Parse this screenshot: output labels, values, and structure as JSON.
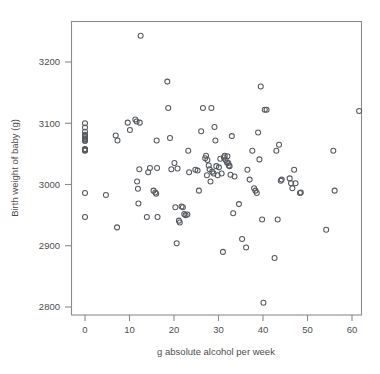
{
  "figure": {
    "title": "",
    "background_color": "#ffffff",
    "point_color": "#555a60",
    "axis_color": "#8a8a8a",
    "text_color": "#4d4d4d"
  },
  "axes": {
    "x_title": "g absolute alcohol per week",
    "y_title": "Birth weight of baby (g)",
    "x_ticks": [
      "0",
      "10",
      "20",
      "30",
      "40",
      "50",
      "60"
    ],
    "y_ticks": [
      "2800",
      "2900",
      "3000",
      "3100",
      "3200"
    ]
  },
  "chart_data": {
    "type": "scatter",
    "title": "",
    "xlabel": "g absolute alcohol per week",
    "ylabel": "Birth weight of baby (g)",
    "xlim": [
      -2.5,
      64.5
    ],
    "ylim": [
      2775,
      3260
    ],
    "x_ticks": [
      0,
      10,
      20,
      30,
      40,
      50,
      60
    ],
    "y_ticks": [
      2800,
      2900,
      3000,
      3100,
      3200
    ],
    "grid": false,
    "legend": null,
    "marker": "open-circle",
    "n_points": 122,
    "x": [
      0,
      0,
      0,
      0,
      0,
      0,
      0,
      0,
      0,
      0,
      0,
      0,
      0,
      0,
      0,
      0,
      0,
      4.7,
      6.9,
      7.3,
      7.2,
      9.6,
      10.1,
      11.3,
      11.6,
      11.7,
      11.9,
      12.0,
      12.2,
      12.3,
      12.5,
      13.9,
      14.2,
      14.6,
      15.4,
      15.8,
      16.0,
      16.1,
      16.2,
      16.3,
      18.5,
      18.7,
      19.1,
      19.4,
      20.1,
      20.3,
      20.6,
      20.8,
      21.1,
      21.3,
      21.7,
      22.0,
      22.3,
      22.6,
      23.0,
      23.2,
      23.4,
      24.8,
      25.3,
      25.6,
      26.1,
      26.5,
      27.0,
      27.2,
      27.4,
      27.5,
      27.8,
      28.0,
      28.2,
      28.4,
      28.6,
      28.9,
      29.1,
      29.3,
      29.5,
      29.8,
      30.1,
      30.4,
      30.7,
      31.0,
      31.2,
      31.4,
      31.6,
      31.9,
      32.0,
      32.2,
      32.3,
      32.5,
      32.7,
      33.0,
      33.3,
      33.6,
      34.6,
      35.3,
      36.2,
      36.5,
      37.0,
      37.6,
      38.0,
      38.3,
      38.6,
      38.9,
      39.2,
      39.5,
      39.8,
      40.1,
      40.4,
      40.8,
      42.6,
      43.0,
      43.3,
      43.6,
      44.0,
      44.2,
      46.0,
      46.3,
      46.6,
      47.0,
      47.3,
      48.3,
      48.5,
      54.2,
      55.8,
      56.1,
      61.6
    ],
    "y": [
      3100,
      3093,
      3086,
      3081,
      3079,
      3077,
      3075,
      3074,
      3072,
      3071,
      3058,
      3057,
      3056,
      3055,
      2986,
      2947,
      3057,
      2983,
      3080,
      3072,
      2930,
      3101,
      3089,
      3106,
      3103,
      3005,
      2993,
      2969,
      3025,
      3101,
      3243,
      2947,
      3020,
      3027,
      2990,
      2987,
      2985,
      3072,
      3027,
      2947,
      3168,
      3125,
      3076,
      3025,
      3035,
      2963,
      2904,
      3026,
      2941,
      2938,
      2964,
      2963,
      2952,
      2950,
      2951,
      3055,
      3020,
      3024,
      3023,
      2990,
      3087,
      3125,
      3043,
      3047,
      3015,
      3040,
      3031,
      3025,
      3005,
      3125,
      3021,
      3018,
      3094,
      3072,
      3030,
      3015,
      3028,
      3042,
      3018,
      2890,
      3044,
      3047,
      3040,
      3036,
      3046,
      3035,
      3031,
      3030,
      3016,
      3079,
      2953,
      3013,
      2968,
      2911,
      2897,
      3024,
      3008,
      3055,
      2994,
      2990,
      2986,
      3085,
      3041,
      3160,
      2943,
      2807,
      3122,
      3122,
      2880,
      3055,
      2943,
      3065,
      3006,
      3008,
      3010,
      3002,
      2994,
      3024,
      3002,
      2986,
      2987,
      2926,
      3055,
      2990,
      3120
    ]
  }
}
